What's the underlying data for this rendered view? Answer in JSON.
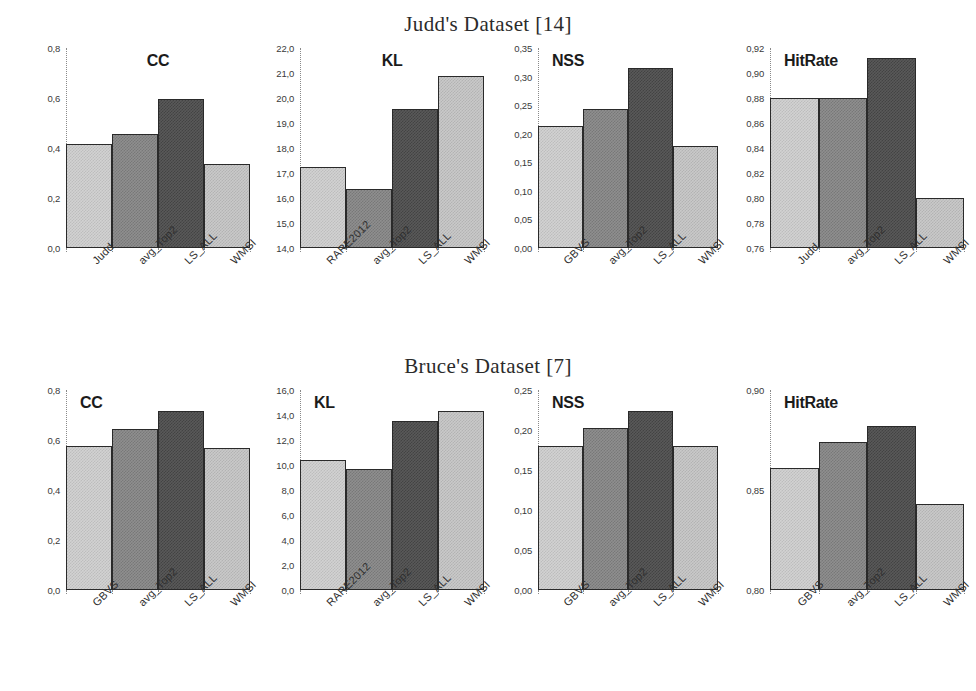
{
  "figure": {
    "series_colors": [
      "#d2d2d2",
      "#8f8f8f",
      "#595959",
      "#c9c9c9"
    ]
  },
  "datasets": [
    {
      "title": "Judd's Dataset [14]",
      "panels": [
        {
          "metric": "CC",
          "title_align": "center",
          "categories": [
            "Judd",
            "avg_Top2",
            "LS_ALL",
            "WMSI"
          ],
          "values": [
            0.415,
            0.455,
            0.598,
            0.338
          ],
          "ylim": [
            0.0,
            0.8
          ],
          "yticks": [
            0.0,
            0.2,
            0.4,
            0.6,
            0.8
          ],
          "yticklabels": [
            "0,0",
            "0,2",
            "0,4",
            "0,6",
            "0,8"
          ]
        },
        {
          "metric": "KL",
          "title_align": "center",
          "categories": [
            "RARE2012",
            "avg_Top2",
            "LS_ALL",
            "WMSI"
          ],
          "values": [
            17.25,
            16.35,
            19.55,
            20.9
          ],
          "ylim": [
            14.0,
            22.0
          ],
          "yticks": [
            14.0,
            15.0,
            16.0,
            17.0,
            18.0,
            19.0,
            20.0,
            21.0,
            22.0
          ],
          "yticklabels": [
            "14,0",
            "15,0",
            "16,0",
            "17,0",
            "18,0",
            "19,0",
            "20,0",
            "21,0",
            "22,0"
          ]
        },
        {
          "metric": "NSS",
          "title_align": "left",
          "categories": [
            "GBVS",
            "avg_Top2",
            "LS_ALL",
            "WMSI"
          ],
          "values": [
            0.213,
            0.243,
            0.315,
            0.178
          ],
          "ylim": [
            0.0,
            0.35
          ],
          "yticks": [
            0.0,
            0.05,
            0.1,
            0.15,
            0.2,
            0.25,
            0.3,
            0.35
          ],
          "yticklabels": [
            "0,00",
            "0,05",
            "0,10",
            "0,15",
            "0,20",
            "0,25",
            "0,30",
            "0,35"
          ]
        },
        {
          "metric": "HitRate",
          "title_align": "left",
          "categories": [
            "Judd",
            "avg_Top2",
            "LS_ALL",
            "WMSI"
          ],
          "values": [
            0.88,
            0.88,
            0.912,
            0.8
          ],
          "ylim": [
            0.76,
            0.92
          ],
          "yticks": [
            0.76,
            0.78,
            0.8,
            0.82,
            0.84,
            0.86,
            0.88,
            0.9,
            0.92
          ],
          "yticklabels": [
            "0,76",
            "0,78",
            "0,80",
            "0,82",
            "0,84",
            "0,86",
            "0,88",
            "0,90",
            "0,92"
          ]
        }
      ]
    },
    {
      "title": "Bruce's Dataset [7]",
      "panels": [
        {
          "metric": "CC",
          "title_align": "center",
          "categories": [
            "GBVS",
            "avg_Top2",
            "LS_ALL",
            "WMSI"
          ],
          "values": [
            0.575,
            0.645,
            0.715,
            0.57
          ],
          "ylim": [
            0.0,
            0.8
          ],
          "yticks": [
            0.0,
            0.2,
            0.4,
            0.6,
            0.8
          ],
          "yticklabels": [
            "0,0",
            "0,2",
            "0,4",
            "0,6",
            "0,8"
          ]
        },
        {
          "metric": "KL",
          "title_align": "left",
          "categories": [
            "RARE2012",
            "avg_Top2",
            "LS_ALL",
            "WMSI"
          ],
          "values": [
            10.4,
            9.7,
            13.5,
            14.3
          ],
          "ylim": [
            0.0,
            16.0
          ],
          "yticks": [
            0.0,
            2.0,
            4.0,
            6.0,
            8.0,
            10.0,
            12.0,
            14.0,
            16.0
          ],
          "yticklabels": [
            "0,0",
            "2,0",
            "4,0",
            "6,0",
            "8,0",
            "10,0",
            "12,0",
            "14,0",
            "16,0"
          ]
        },
        {
          "metric": "NSS",
          "title_align": "left",
          "categories": [
            "GBVS",
            "avg_Top2",
            "LS_ALL",
            "WMSI"
          ],
          "values": [
            0.18,
            0.202,
            0.224,
            0.18
          ],
          "ylim": [
            0.0,
            0.25
          ],
          "yticks": [
            0.0,
            0.05,
            0.1,
            0.15,
            0.2,
            0.25
          ],
          "yticklabels": [
            "0,00",
            "0,05",
            "0,10",
            "0,15",
            "0,20",
            "0,25"
          ]
        },
        {
          "metric": "HitRate",
          "title_align": "left",
          "categories": [
            "GBVS",
            "avg_Top2",
            "LS_ALL",
            "WMSI"
          ],
          "values": [
            0.861,
            0.874,
            0.882,
            0.843
          ],
          "ylim": [
            0.8,
            0.9
          ],
          "yticks": [
            0.8,
            0.85,
            0.9
          ],
          "yticklabels": [
            "0,80",
            "0,85",
            "0,90"
          ]
        }
      ]
    }
  ],
  "chart_data": [
    {
      "type": "bar",
      "title": "Judd's Dataset [14] - CC",
      "xlabel": "",
      "ylabel": "CC",
      "categories": [
        "Judd",
        "avg_Top2",
        "LS_ALL",
        "WMSI"
      ],
      "values": [
        0.415,
        0.455,
        0.598,
        0.338
      ],
      "ylim": [
        0.0,
        0.8
      ],
      "yticklabels": [
        "0,0",
        "0,2",
        "0,4",
        "0,6",
        "0,8"
      ],
      "grid": false,
      "legend": "none"
    },
    {
      "type": "bar",
      "title": "Judd's Dataset [14] - KL",
      "xlabel": "",
      "ylabel": "KL",
      "categories": [
        "RARE2012",
        "avg_Top2",
        "LS_ALL",
        "WMSI"
      ],
      "values": [
        17.25,
        16.35,
        19.55,
        20.9
      ],
      "ylim": [
        14.0,
        22.0
      ],
      "yticklabels": [
        "14,0",
        "15,0",
        "16,0",
        "17,0",
        "18,0",
        "19,0",
        "20,0",
        "21,0",
        "22,0"
      ],
      "grid": false,
      "legend": "none"
    },
    {
      "type": "bar",
      "title": "Judd's Dataset [14] - NSS",
      "xlabel": "",
      "ylabel": "NSS",
      "categories": [
        "GBVS",
        "avg_Top2",
        "LS_ALL",
        "WMSI"
      ],
      "values": [
        0.213,
        0.243,
        0.315,
        0.178
      ],
      "ylim": [
        0.0,
        0.35
      ],
      "yticklabels": [
        "0,00",
        "0,05",
        "0,10",
        "0,15",
        "0,20",
        "0,25",
        "0,30",
        "0,35"
      ],
      "grid": false,
      "legend": "none"
    },
    {
      "type": "bar",
      "title": "Judd's Dataset [14] - HitRate",
      "xlabel": "",
      "ylabel": "HitRate",
      "categories": [
        "Judd",
        "avg_Top2",
        "LS_ALL",
        "WMSI"
      ],
      "values": [
        0.88,
        0.88,
        0.912,
        0.8
      ],
      "ylim": [
        0.76,
        0.92
      ],
      "yticklabels": [
        "0,76",
        "0,78",
        "0,80",
        "0,82",
        "0,84",
        "0,86",
        "0,88",
        "0,90",
        "0,92"
      ],
      "grid": false,
      "legend": "none"
    },
    {
      "type": "bar",
      "title": "Bruce's Dataset [7] - CC",
      "xlabel": "",
      "ylabel": "CC",
      "categories": [
        "GBVS",
        "avg_Top2",
        "LS_ALL",
        "WMSI"
      ],
      "values": [
        0.575,
        0.645,
        0.715,
        0.57
      ],
      "ylim": [
        0.0,
        0.8
      ],
      "yticklabels": [
        "0,0",
        "0,2",
        "0,4",
        "0,6",
        "0,8"
      ],
      "grid": false,
      "legend": "none"
    },
    {
      "type": "bar",
      "title": "Bruce's Dataset [7] - KL",
      "xlabel": "",
      "ylabel": "KL",
      "categories": [
        "RARE2012",
        "avg_Top2",
        "LS_ALL",
        "WMSI"
      ],
      "values": [
        10.4,
        9.7,
        13.5,
        14.3
      ],
      "ylim": [
        0.0,
        16.0
      ],
      "yticklabels": [
        "0,0",
        "2,0",
        "4,0",
        "6,0",
        "8,0",
        "10,0",
        "12,0",
        "14,0",
        "16,0"
      ],
      "grid": false,
      "legend": "none"
    },
    {
      "type": "bar",
      "title": "Bruce's Dataset [7] - NSS",
      "xlabel": "",
      "ylabel": "NSS",
      "categories": [
        "GBVS",
        "avg_Top2",
        "LS_ALL",
        "WMSI"
      ],
      "values": [
        0.18,
        0.202,
        0.224,
        0.18
      ],
      "ylim": [
        0.0,
        0.25
      ],
      "yticklabels": [
        "0,00",
        "0,05",
        "0,10",
        "0,15",
        "0,20",
        "0,25"
      ],
      "grid": false,
      "legend": "none"
    },
    {
      "type": "bar",
      "title": "Bruce's Dataset [7] - HitRate",
      "xlabel": "",
      "ylabel": "HitRate",
      "categories": [
        "GBVS",
        "avg_Top2",
        "LS_ALL",
        "WMSI"
      ],
      "values": [
        0.861,
        0.874,
        0.882,
        0.843
      ],
      "ylim": [
        0.8,
        0.9
      ],
      "yticklabels": [
        "0,80",
        "0,85",
        "0,90"
      ],
      "grid": false,
      "legend": "none"
    }
  ]
}
